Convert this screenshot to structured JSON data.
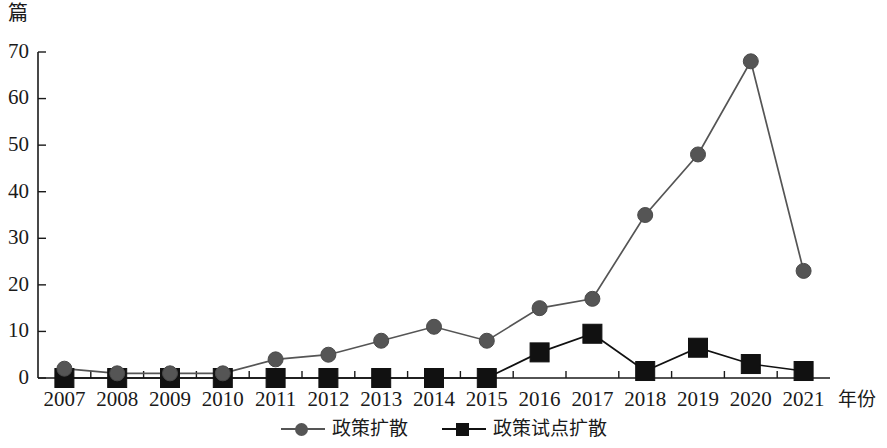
{
  "chart_data": {
    "type": "line",
    "title": "",
    "xlabel": "年份",
    "ylabel": "篇",
    "categories": [
      "2007",
      "2008",
      "2009",
      "2010",
      "2011",
      "2012",
      "2013",
      "2014",
      "2015",
      "2016",
      "2017",
      "2018",
      "2019",
      "2020",
      "2021"
    ],
    "series": [
      {
        "name": "政策扩散",
        "marker": "circle",
        "color": "#555555",
        "values": [
          2,
          1,
          1,
          1,
          4,
          5,
          8,
          11,
          8,
          15,
          17,
          35,
          48,
          68,
          23
        ]
      },
      {
        "name": "政策试点扩散",
        "marker": "square",
        "color": "#111111",
        "values": [
          0,
          0,
          0,
          0,
          0,
          0,
          0,
          0,
          0,
          5.5,
          9.5,
          1.5,
          6.5,
          3,
          1.5
        ]
      }
    ],
    "ylim": [
      0,
      70
    ],
    "yticks": [
      0,
      10,
      20,
      30,
      40,
      50,
      60,
      70
    ],
    "ytick_labels": [
      "0",
      "10",
      "20",
      "30",
      "40",
      "50",
      "60",
      "70"
    ],
    "grid": false,
    "legend_position": "bottom-center"
  },
  "axis": {
    "unit_label": "篇",
    "x_axis_title": "年份"
  },
  "legend": {
    "entries": [
      {
        "label": "政策扩散",
        "marker": "circle-marker-icon"
      },
      {
        "label": "政策试点扩散",
        "marker": "square-marker-icon"
      }
    ]
  }
}
